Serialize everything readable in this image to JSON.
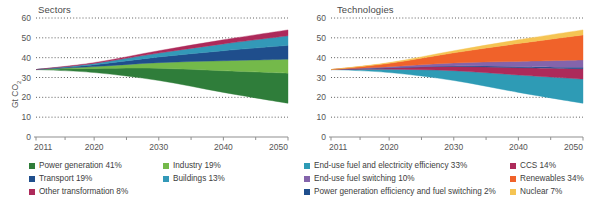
{
  "figure": {
    "ylabel": "Gt CO",
    "ylabel_sub": "2",
    "width": 591,
    "height": 200
  },
  "panels": [
    {
      "id": "sectors",
      "title": "Sectors",
      "ylim": [
        0,
        60
      ],
      "yticks": [
        0,
        10,
        20,
        30,
        40,
        50,
        60
      ],
      "xlim": [
        2011,
        2050
      ],
      "xticks": [
        2011,
        2020,
        2030,
        2040,
        2050
      ],
      "xticklabels": [
        "2011",
        "2020",
        "2030",
        "2040",
        "2050"
      ]
    },
    {
      "id": "technologies",
      "title": "Technologies",
      "ylim": [
        0,
        60
      ],
      "yticks": [
        0,
        10,
        20,
        30,
        40,
        50,
        60
      ],
      "xlim": [
        2011,
        2050
      ],
      "xticks": [
        2011,
        2020,
        2030,
        2040,
        2050
      ],
      "xticklabels": [
        "2011",
        "2020",
        "2030",
        "2040",
        "2050"
      ]
    }
  ],
  "legends": {
    "sectors": [
      {
        "label": "Power generation  41%",
        "color": "#2f7d3a"
      },
      {
        "label": "Industry  19%",
        "color": "#74b94a"
      },
      {
        "label": "Transport  19%",
        "color": "#1f4e8c"
      },
      {
        "label": "Buildings 13%",
        "color": "#3399b8"
      },
      {
        "label": "Other transformation  8%",
        "color": "#ad2a5a"
      }
    ],
    "technologies": [
      {
        "label": "End-use fuel and electricity efficiency 33%",
        "color": "#2e9bb5"
      },
      {
        "label": "End-use fuel switching 10%",
        "color": "#8464ab"
      },
      {
        "label": "Power generation efficiency and fuel switching 2%",
        "color": "#1f4e8c"
      },
      {
        "label": "CCS 14%",
        "color": "#ad2a5a"
      },
      {
        "label": "Renewables 34%",
        "color": "#f0622a"
      },
      {
        "label": "Nuclear 7%",
        "color": "#f5c453"
      }
    ]
  },
  "chart_data": [
    {
      "type": "area",
      "title": "Sectors",
      "xlabel": "",
      "ylabel": "Gt CO2",
      "xlim": [
        2011,
        2050
      ],
      "ylim": [
        0,
        60
      ],
      "grid": true,
      "legend_position": "below",
      "note": "Stacked wedge diagram: the total band spans from a 6DS (upper) emissions path down to a 2DS (lower) path. Series values are the abatement wedge thickness in Gt CO2 at each year, stacked from the lower (2DS) boundary upward.",
      "x": [
        2011,
        2020,
        2030,
        2040,
        2050
      ],
      "baseline_lower": [
        34,
        32.5,
        28.5,
        22.5,
        17
      ],
      "baseline_upper": [
        34,
        37.5,
        43.5,
        49,
        54
      ],
      "series": [
        {
          "name": "Power generation  41%",
          "color": "#2f7d3a",
          "values": [
            0,
            2.05,
            6.15,
            10.9,
            15.2
          ]
        },
        {
          "name": "Industry  19%",
          "color": "#74b94a",
          "values": [
            0,
            0.95,
            2.85,
            5.05,
            7.0
          ]
        },
        {
          "name": "Transport  19%",
          "color": "#1f4e8c",
          "values": [
            0,
            0.95,
            2.85,
            5.05,
            7.0
          ]
        },
        {
          "name": "Buildings 13%",
          "color": "#3399b8",
          "values": [
            0,
            0.65,
            1.95,
            3.45,
            4.8
          ]
        },
        {
          "name": "Other transformation  8%",
          "color": "#ad2a5a",
          "values": [
            0,
            0.4,
            1.2,
            2.05,
            3.0
          ]
        }
      ]
    },
    {
      "type": "area",
      "title": "Technologies",
      "xlabel": "",
      "ylabel": "Gt CO2",
      "xlim": [
        2011,
        2050
      ],
      "ylim": [
        0,
        60
      ],
      "grid": true,
      "legend_position": "below",
      "note": "Same total wedge as the Sectors panel, decomposed by abatement technology instead of by sector.",
      "x": [
        2011,
        2020,
        2030,
        2040,
        2050
      ],
      "baseline_lower": [
        34,
        32.5,
        28.5,
        22.5,
        17
      ],
      "baseline_upper": [
        34,
        37.5,
        43.5,
        49,
        54
      ],
      "series": [
        {
          "name": "End-use fuel and electricity efficiency 33%",
          "color": "#2e9bb5",
          "values": [
            0,
            1.65,
            4.95,
            8.75,
            12.2
          ]
        },
        {
          "name": "CCS 14%",
          "color": "#ad2a5a",
          "values": [
            0,
            0.7,
            2.1,
            3.7,
            5.2
          ]
        },
        {
          "name": "Power generation efficiency and fuel switching 2%",
          "color": "#1f4e8c",
          "values": [
            0,
            0.1,
            0.3,
            0.53,
            0.74
          ]
        },
        {
          "name": "End-use fuel switching 10%",
          "color": "#8464ab",
          "values": [
            0,
            0.5,
            1.5,
            2.65,
            3.7
          ]
        },
        {
          "name": "Renewables 34%",
          "color": "#f0622a",
          "values": [
            0,
            1.7,
            5.1,
            9.0,
            12.6
          ]
        },
        {
          "name": "Nuclear 7%",
          "color": "#f5c453",
          "values": [
            0,
            0.35,
            1.05,
            1.87,
            2.56
          ]
        }
      ]
    }
  ]
}
